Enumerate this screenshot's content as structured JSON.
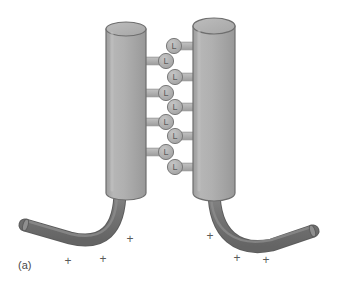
{
  "figure": {
    "panel_label": "(a)",
    "background_color": "#ffffff",
    "width": 339,
    "height": 303
  },
  "palette": {
    "cylinder_body": "#a9a9a9",
    "cylinder_body_light": "#bcbcbc",
    "cylinder_body_dark": "#9a9a9a",
    "cylinder_top_face": "#b4b4b4",
    "cylinder_outline": "#6e6e6e",
    "tail_fill": "#6f6f6f",
    "tail_fill_light": "#868686",
    "tail_outline": "#5a5a5a",
    "linker_fill": "#b0b0b0",
    "linker_outline": "#7a7a7a",
    "stem_fill": "#b0b0b0",
    "stem_outline": "#8a8a8a",
    "label_color": "#4a4a4a",
    "charge_color": "#5a5a5a"
  },
  "cylinders": [
    {
      "name": "left-helix",
      "cx": 126,
      "top_y": 22,
      "bottom_y": 193,
      "rx": 20,
      "ry": 7
    },
    {
      "name": "right-helix",
      "cx": 214,
      "top_y": 18,
      "bottom_y": 193,
      "rx": 21,
      "ry": 8
    }
  ],
  "linkers": [
    {
      "index": 1,
      "glyph": "L",
      "cx": 174,
      "cy": 46,
      "side": "right",
      "r": 7.5
    },
    {
      "index": 2,
      "glyph": "L",
      "cx": 166,
      "cy": 61,
      "side": "left",
      "r": 7.5
    },
    {
      "index": 3,
      "glyph": "L",
      "cx": 175,
      "cy": 77,
      "side": "right",
      "r": 7.5
    },
    {
      "index": 4,
      "glyph": "L",
      "cx": 166,
      "cy": 93,
      "side": "left",
      "r": 7.5
    },
    {
      "index": 5,
      "glyph": "L",
      "cx": 175,
      "cy": 107,
      "side": "right",
      "r": 7.5
    },
    {
      "index": 6,
      "glyph": "L",
      "cx": 166,
      "cy": 122,
      "side": "left",
      "r": 7.5
    },
    {
      "index": 7,
      "glyph": "L",
      "cx": 175,
      "cy": 136,
      "side": "right",
      "r": 7.5
    },
    {
      "index": 8,
      "glyph": "L",
      "cx": 166,
      "cy": 152,
      "side": "left",
      "r": 7.5
    },
    {
      "index": 9,
      "glyph": "L",
      "cx": 175,
      "cy": 167,
      "side": "right",
      "r": 7.5
    }
  ],
  "tails": [
    {
      "name": "left-tail",
      "path": "M 126 193 C 126 232, 106 248, 72 241 L 26 228",
      "width": 11
    },
    {
      "name": "right-tail",
      "path": "M 214 193 C 214 236, 238 254, 272 248 L 312 233",
      "width": 11
    }
  ],
  "charges": [
    {
      "symbol": "+",
      "x": 130,
      "y": 243
    },
    {
      "symbol": "+",
      "x": 68,
      "y": 265
    },
    {
      "symbol": "+",
      "x": 103,
      "y": 263
    },
    {
      "symbol": "+",
      "x": 210,
      "y": 240
    },
    {
      "symbol": "+",
      "x": 237,
      "y": 262
    },
    {
      "symbol": "+",
      "x": 266,
      "y": 264
    }
  ]
}
